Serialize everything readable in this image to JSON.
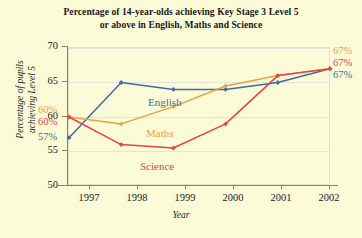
{
  "title": {
    "line1": "Percentage of 14-year-olds achieving Key Stage 3 Level 5",
    "line2": "or above in English, Maths and Science"
  },
  "axes": {
    "xlabel": "Year",
    "ylabel_line1": "Percentage of pupils",
    "ylabel_line2": "achieving Level 5"
  },
  "colors": {
    "english": "#3a6ea5",
    "maths": "#e8a33d",
    "science": "#e8443f",
    "background": "#fcfbd8",
    "grid": "#e2e4dd",
    "axis": "#8a8268"
  },
  "series_labels": {
    "english": "English",
    "maths": "Maths",
    "science": "Science"
  },
  "start_labels": {
    "maths": "60%",
    "science": "60%",
    "english": "57%"
  },
  "end_labels": {
    "maths": "67%",
    "science": "67%",
    "english": "67%"
  },
  "chart_data": {
    "type": "line",
    "title": "Percentage of 14-year-olds achieving Key Stage 3 Level 5 or above in English, Maths and Science",
    "xlabel": "Year",
    "ylabel": "Percentage of pupils achieving Level 5",
    "categories": [
      "1997",
      "1998",
      "1999",
      "2000",
      "2001",
      "2002"
    ],
    "xticks": [
      "1997",
      "1998",
      "1999",
      "2000",
      "2001",
      "2002"
    ],
    "yticks": [
      50,
      55,
      60,
      65,
      70
    ],
    "ylim": [
      50,
      70
    ],
    "grid": true,
    "legend": "inline-labels",
    "series": [
      {
        "name": "English",
        "color": "#3a6ea5",
        "values": [
          57,
          65,
          64,
          64,
          65,
          67
        ]
      },
      {
        "name": "Maths",
        "color": "#e8a33d",
        "values": [
          60,
          59,
          61.5,
          64.5,
          66,
          67
        ]
      },
      {
        "name": "Science",
        "color": "#e8443f",
        "values": [
          60,
          56,
          55.5,
          59,
          66,
          67
        ]
      }
    ],
    "annotations": [
      {
        "text": "60%",
        "series": "Maths",
        "position": "start"
      },
      {
        "text": "60%",
        "series": "Science",
        "position": "start"
      },
      {
        "text": "57%",
        "series": "English",
        "position": "start"
      },
      {
        "text": "67%",
        "series": "Maths",
        "position": "end"
      },
      {
        "text": "67%",
        "series": "Science",
        "position": "end"
      },
      {
        "text": "67%",
        "series": "English",
        "position": "end"
      }
    ]
  }
}
